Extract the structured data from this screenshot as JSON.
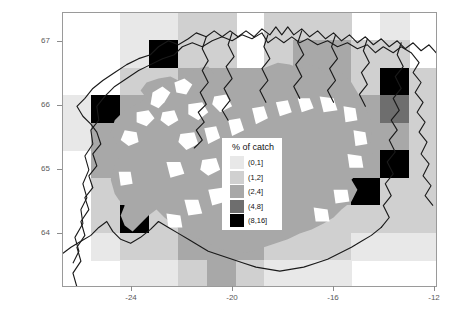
{
  "chart_data": {
    "type": "heatmap",
    "title": "",
    "xlabel": "",
    "ylabel": "",
    "xlim": [
      -26.05,
      -11.1
    ],
    "ylim": [
      63.25,
      67.55
    ],
    "xticks": [
      "-24",
      "-20",
      "-16",
      "-12"
    ],
    "xtick_values": [
      -24,
      -20,
      -16,
      -12
    ],
    "yticks": [
      "67",
      "66",
      "65",
      "64"
    ],
    "ytick_values": [
      67,
      66,
      65,
      64
    ],
    "grid": false,
    "legend_position": "center",
    "cell_width_deg": 1.15,
    "cell_height_deg": 0.43,
    "colors": {
      "bin_0_1": "#e8e8e8",
      "bin_1_2": "#d0d0d0",
      "bin_2_4": "#a8a8a8",
      "bin_4_8": "#6e6e6e",
      "bin_8_16": "#000000",
      "background": "#ffffff",
      "land_fill": "#a8a8a8",
      "coastline": "#1a1a1a",
      "frame": "#9a9a9a"
    },
    "bins": [
      {
        "label": "(0,1]",
        "color": "#e8e8e8",
        "min": 0,
        "max": 1
      },
      {
        "label": "(1,2]",
        "color": "#d0d0d0",
        "min": 1,
        "max": 2
      },
      {
        "label": "(2,4]",
        "color": "#a8a8a8",
        "min": 2,
        "max": 4
      },
      {
        "label": "(4,8]",
        "color": "#6e6e6e",
        "min": 4,
        "max": 8
      },
      {
        "label": "(8,16]",
        "color": "#000000",
        "min": 8,
        "max": 16
      }
    ],
    "cells": [
      {
        "col": 2,
        "row": 0,
        "bin": 0
      },
      {
        "col": 3,
        "row": 0,
        "bin": 0
      },
      {
        "col": 4,
        "row": 0,
        "bin": 1
      },
      {
        "col": 5,
        "row": 0,
        "bin": 1
      },
      {
        "col": 7,
        "row": 0,
        "bin": 1
      },
      {
        "col": 8,
        "row": 0,
        "bin": 1
      },
      {
        "col": 9,
        "row": 0,
        "bin": 1
      },
      {
        "col": 11,
        "row": 0,
        "bin": 0
      },
      {
        "col": 2,
        "row": 1,
        "bin": 0
      },
      {
        "col": 3,
        "row": 1,
        "bin": 4
      },
      {
        "col": 4,
        "row": 1,
        "bin": 1
      },
      {
        "col": 5,
        "row": 1,
        "bin": 1
      },
      {
        "col": 7,
        "row": 1,
        "bin": 1
      },
      {
        "col": 8,
        "row": 1,
        "bin": 2
      },
      {
        "col": 9,
        "row": 1,
        "bin": 2
      },
      {
        "col": 10,
        "row": 1,
        "bin": 1
      },
      {
        "col": 11,
        "row": 1,
        "bin": 1
      },
      {
        "col": 2,
        "row": 2,
        "bin": 1
      },
      {
        "col": 3,
        "row": 2,
        "bin": 1
      },
      {
        "col": 4,
        "row": 2,
        "bin": 2
      },
      {
        "col": 5,
        "row": 2,
        "bin": 2
      },
      {
        "col": 6,
        "row": 2,
        "bin": 2
      },
      {
        "col": 7,
        "row": 2,
        "bin": 2
      },
      {
        "col": 8,
        "row": 2,
        "bin": 2
      },
      {
        "col": 9,
        "row": 2,
        "bin": 2
      },
      {
        "col": 10,
        "row": 2,
        "bin": 1
      },
      {
        "col": 11,
        "row": 2,
        "bin": 4
      },
      {
        "col": 12,
        "row": 2,
        "bin": 1
      },
      {
        "col": 0,
        "row": 3,
        "bin": 0
      },
      {
        "col": 1,
        "row": 3,
        "bin": 4
      },
      {
        "col": 2,
        "row": 3,
        "bin": 2
      },
      {
        "col": 3,
        "row": 3,
        "bin": 2
      },
      {
        "col": 4,
        "row": 3,
        "bin": 2
      },
      {
        "col": 5,
        "row": 3,
        "bin": 2
      },
      {
        "col": 6,
        "row": 3,
        "bin": 2
      },
      {
        "col": 7,
        "row": 3,
        "bin": 2
      },
      {
        "col": 8,
        "row": 3,
        "bin": 2
      },
      {
        "col": 9,
        "row": 3,
        "bin": 2
      },
      {
        "col": 10,
        "row": 3,
        "bin": 2
      },
      {
        "col": 11,
        "row": 3,
        "bin": 3
      },
      {
        "col": 12,
        "row": 3,
        "bin": 1
      },
      {
        "col": 0,
        "row": 4,
        "bin": 0
      },
      {
        "col": 1,
        "row": 4,
        "bin": 2
      },
      {
        "col": 2,
        "row": 4,
        "bin": 2
      },
      {
        "col": 3,
        "row": 4,
        "bin": 1
      },
      {
        "col": 4,
        "row": 4,
        "bin": 2
      },
      {
        "col": 5,
        "row": 4,
        "bin": 2
      },
      {
        "col": 6,
        "row": 4,
        "bin": 2
      },
      {
        "col": 7,
        "row": 4,
        "bin": 2
      },
      {
        "col": 8,
        "row": 4,
        "bin": 2
      },
      {
        "col": 9,
        "row": 4,
        "bin": 2
      },
      {
        "col": 10,
        "row": 4,
        "bin": 2
      },
      {
        "col": 11,
        "row": 4,
        "bin": 2
      },
      {
        "col": 12,
        "row": 4,
        "bin": 1
      },
      {
        "col": 1,
        "row": 5,
        "bin": 2
      },
      {
        "col": 2,
        "row": 5,
        "bin": 2
      },
      {
        "col": 3,
        "row": 5,
        "bin": 1
      },
      {
        "col": 4,
        "row": 5,
        "bin": 2
      },
      {
        "col": 5,
        "row": 5,
        "bin": 2
      },
      {
        "col": 6,
        "row": 5,
        "bin": 2
      },
      {
        "col": 7,
        "row": 5,
        "bin": 2
      },
      {
        "col": 8,
        "row": 5,
        "bin": 2
      },
      {
        "col": 9,
        "row": 5,
        "bin": 2
      },
      {
        "col": 10,
        "row": 5,
        "bin": 2
      },
      {
        "col": 11,
        "row": 5,
        "bin": 4
      },
      {
        "col": 12,
        "row": 5,
        "bin": 1
      },
      {
        "col": 1,
        "row": 6,
        "bin": 1
      },
      {
        "col": 2,
        "row": 6,
        "bin": 2
      },
      {
        "col": 3,
        "row": 6,
        "bin": 2
      },
      {
        "col": 4,
        "row": 6,
        "bin": 2
      },
      {
        "col": 5,
        "row": 6,
        "bin": 2
      },
      {
        "col": 6,
        "row": 6,
        "bin": 2
      },
      {
        "col": 7,
        "row": 6,
        "bin": 2
      },
      {
        "col": 8,
        "row": 6,
        "bin": 2
      },
      {
        "col": 9,
        "row": 6,
        "bin": 2
      },
      {
        "col": 10,
        "row": 6,
        "bin": 4
      },
      {
        "col": 11,
        "row": 6,
        "bin": 1
      },
      {
        "col": 12,
        "row": 6,
        "bin": 1
      },
      {
        "col": 1,
        "row": 7,
        "bin": 1
      },
      {
        "col": 2,
        "row": 7,
        "bin": 4
      },
      {
        "col": 3,
        "row": 7,
        "bin": 1
      },
      {
        "col": 4,
        "row": 7,
        "bin": 2
      },
      {
        "col": 5,
        "row": 7,
        "bin": 2
      },
      {
        "col": 6,
        "row": 7,
        "bin": 2
      },
      {
        "col": 7,
        "row": 7,
        "bin": 2
      },
      {
        "col": 8,
        "row": 7,
        "bin": 1
      },
      {
        "col": 9,
        "row": 7,
        "bin": 1
      },
      {
        "col": 10,
        "row": 7,
        "bin": 1
      },
      {
        "col": 11,
        "row": 7,
        "bin": 1
      },
      {
        "col": 12,
        "row": 7,
        "bin": 1
      },
      {
        "col": 1,
        "row": 8,
        "bin": 0
      },
      {
        "col": 2,
        "row": 8,
        "bin": 1
      },
      {
        "col": 3,
        "row": 8,
        "bin": 1
      },
      {
        "col": 4,
        "row": 8,
        "bin": 2
      },
      {
        "col": 5,
        "row": 8,
        "bin": 2
      },
      {
        "col": 6,
        "row": 8,
        "bin": 2
      },
      {
        "col": 7,
        "row": 8,
        "bin": 1
      },
      {
        "col": 8,
        "row": 8,
        "bin": 1
      },
      {
        "col": 9,
        "row": 8,
        "bin": 1
      },
      {
        "col": 10,
        "row": 8,
        "bin": 0
      },
      {
        "col": 11,
        "row": 8,
        "bin": 0
      },
      {
        "col": 12,
        "row": 8,
        "bin": 0
      },
      {
        "col": 2,
        "row": 9,
        "bin": 0
      },
      {
        "col": 3,
        "row": 9,
        "bin": 0
      },
      {
        "col": 4,
        "row": 9,
        "bin": 1
      },
      {
        "col": 5,
        "row": 9,
        "bin": 2
      },
      {
        "col": 6,
        "row": 9,
        "bin": 1
      },
      {
        "col": 7,
        "row": 9,
        "bin": 0
      },
      {
        "col": 8,
        "row": 9,
        "bin": 0
      },
      {
        "col": 9,
        "row": 9,
        "bin": 0
      }
    ]
  },
  "legend": {
    "title": "% of catch",
    "entries": [
      "(0,1]",
      "(1,2]",
      "(2,4]",
      "(4,8]",
      "(8,16]"
    ]
  },
  "axes": {
    "x_tick_labels": [
      "-24",
      "-20",
      "-16",
      "-12"
    ],
    "y_tick_labels": [
      "67",
      "66",
      "65",
      "64"
    ]
  }
}
